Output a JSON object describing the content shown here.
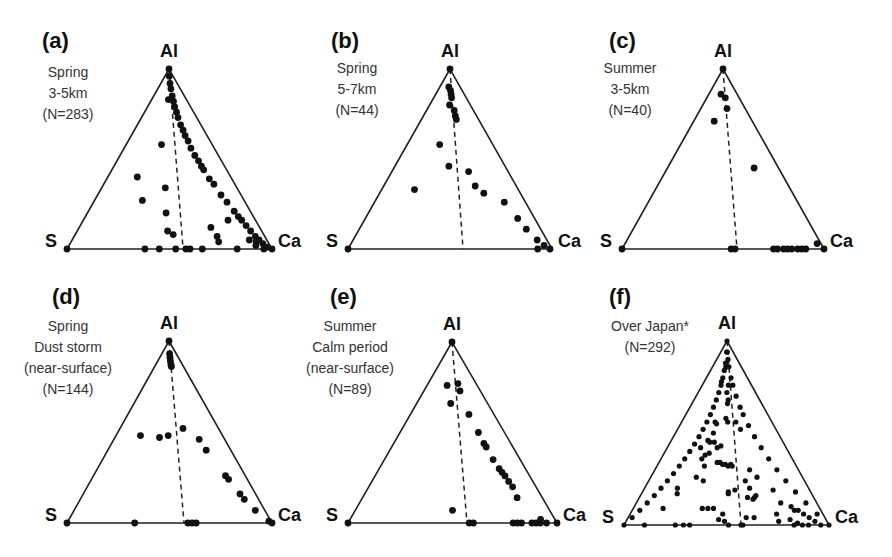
{
  "chart_data": [
    {
      "type": "scatter",
      "subtype": "ternary",
      "panel": "(a)",
      "title_lines": [
        "Spring",
        "3-5km",
        "(N=283)"
      ],
      "vertices": {
        "top": "Al",
        "left": "S",
        "right": "Ca"
      },
      "geom": {
        "apex": [
          169,
          69
        ],
        "left": [
          67,
          249
        ],
        "right": [
          272,
          249
        ],
        "dash_end": [
          183,
          248
        ],
        "letter_pos": [
          42,
          48
        ],
        "text_x": 68,
        "text_y": 77
      },
      "points_uv": [
        [
          0.5,
          1
        ],
        [
          0.54,
          0.96
        ],
        [
          0.56,
          0.92
        ],
        [
          0.58,
          0.89
        ],
        [
          0.6,
          0.85
        ],
        [
          0.62,
          0.82
        ],
        [
          0.63,
          0.79
        ],
        [
          0.65,
          0.76
        ],
        [
          0.66,
          0.73
        ],
        [
          0.68,
          0.69
        ],
        [
          0.7,
          0.66
        ],
        [
          0.71,
          0.63
        ],
        [
          0.73,
          0.6
        ],
        [
          0.74,
          0.56
        ],
        [
          0.76,
          0.52
        ],
        [
          0.78,
          0.49
        ],
        [
          0.79,
          0.46
        ],
        [
          0.8,
          0.44
        ],
        [
          0.82,
          0.39
        ],
        [
          0.84,
          0.36
        ],
        [
          0.86,
          0.3
        ],
        [
          0.88,
          0.26
        ],
        [
          0.9,
          0.21
        ],
        [
          0.91,
          0.18
        ],
        [
          0.92,
          0.16
        ],
        [
          0.93,
          0.13
        ],
        [
          0.94,
          0.1
        ],
        [
          0.95,
          0.07
        ],
        [
          0.96,
          0.05
        ],
        [
          0.97,
          0.03
        ],
        [
          0.98,
          0.01
        ],
        [
          1,
          0
        ],
        [
          0.96,
          0
        ],
        [
          0.93,
          0.02
        ],
        [
          0.91,
          0.05
        ],
        [
          0.94,
          0.04
        ],
        [
          0.84,
          0.16
        ],
        [
          0.73,
          0.12
        ],
        [
          0.75,
          0.07
        ],
        [
          0.75,
          0.04
        ],
        [
          0.66,
          0
        ],
        [
          0.83,
          0
        ],
        [
          0.58,
          0
        ],
        [
          0.6,
          0
        ],
        [
          0.53,
          0
        ],
        [
          0.38,
          0
        ],
        [
          0.45,
          0
        ],
        [
          0,
          0
        ],
        [
          0.24,
          0.4
        ],
        [
          0.32,
          0.27
        ],
        [
          0.48,
          0.83
        ],
        [
          0.41,
          0.58
        ],
        [
          0.47,
          0.34
        ],
        [
          0.48,
          0.2
        ],
        [
          0.49,
          0.1
        ],
        [
          0.52,
          0.08
        ]
      ]
    },
    {
      "type": "scatter",
      "subtype": "ternary",
      "panel": "(b)",
      "title_lines": [
        "Spring",
        "5-7km",
        "(N=44)"
      ],
      "vertices": {
        "top": "Al",
        "left": "S",
        "right": "Ca"
      },
      "geom": {
        "apex": [
          450,
          69
        ],
        "left": [
          348,
          249
        ],
        "right": [
          552,
          249
        ],
        "dash_end": [
          463,
          249
        ],
        "letter_pos": [
          331,
          48
        ],
        "text_x": 357,
        "text_y": 73
      },
      "points_uv": [
        [
          0.5,
          1
        ],
        [
          0.44,
          0.9
        ],
        [
          0.52,
          0.88
        ],
        [
          0.54,
          0.86
        ],
        [
          0.55,
          0.84
        ],
        [
          0.59,
          0.77
        ],
        [
          0.6,
          0.74
        ],
        [
          0.61,
          0.72
        ],
        [
          0.49,
          0.8
        ],
        [
          0.38,
          0.58
        ],
        [
          0.24,
          0.33
        ],
        [
          0.49,
          0.46
        ],
        [
          0.66,
          0.43
        ],
        [
          0.69,
          0.35
        ],
        [
          0.74,
          0.31
        ],
        [
          0.86,
          0.26
        ],
        [
          0.9,
          0.17
        ],
        [
          0.92,
          0.11
        ],
        [
          0.95,
          0.05
        ],
        [
          0.97,
          0.02
        ],
        [
          0.99,
          0
        ],
        [
          0.93,
          0
        ],
        [
          0,
          0
        ]
      ]
    },
    {
      "type": "scatter",
      "subtype": "ternary",
      "panel": "(c)",
      "title_lines": [
        "Summer",
        "3-5km",
        "(N=40)"
      ],
      "vertices": {
        "top": "Al",
        "left": "S",
        "right": "Ca"
      },
      "geom": {
        "apex": [
          723,
          69
        ],
        "left": [
          622,
          249
        ],
        "right": [
          824,
          249
        ],
        "dash_end": [
          737,
          249
        ],
        "letter_pos": [
          609,
          48
        ],
        "text_x": 630,
        "text_y": 73
      },
      "points_uv": [
        [
          0.5,
          1
        ],
        [
          0.43,
          0.86
        ],
        [
          0.35,
          0.71
        ],
        [
          0.57,
          0.84
        ],
        [
          0.59,
          0.78
        ],
        [
          0.78,
          0.45
        ],
        [
          0.98,
          0.03
        ],
        [
          1,
          0
        ],
        [
          0.54,
          0
        ],
        [
          0.56,
          0
        ],
        [
          0.75,
          0
        ],
        [
          0.77,
          0
        ],
        [
          0.8,
          0
        ],
        [
          0.82,
          0
        ],
        [
          0.84,
          0
        ],
        [
          0.87,
          0
        ],
        [
          0.89,
          0
        ],
        [
          0.91,
          0
        ],
        [
          0,
          0
        ]
      ]
    },
    {
      "type": "scatter",
      "subtype": "ternary",
      "panel": "(d)",
      "title_lines": [
        "Spring",
        "Dust storm",
        "(near-surface)",
        "(N=144)"
      ],
      "vertices": {
        "top": "Al",
        "left": "S",
        "right": "Ca"
      },
      "geom": {
        "apex": [
          169,
          341
        ],
        "left": [
          67,
          523
        ],
        "right": [
          272,
          523
        ],
        "dash_end": [
          184,
          523
        ],
        "letter_pos": [
          52,
          304
        ],
        "text_x": 68,
        "text_y": 331
      },
      "points_uv": [
        [
          0.5,
          1
        ],
        [
          0.54,
          0.93
        ],
        [
          0.55,
          0.91
        ],
        [
          0.56,
          0.89
        ],
        [
          0.57,
          0.87
        ],
        [
          0.58,
          0.86
        ],
        [
          0.77,
          0.46
        ],
        [
          0.8,
          0.4
        ],
        [
          0.87,
          0.26
        ],
        [
          0.88,
          0.24
        ],
        [
          0.91,
          0.16
        ],
        [
          0.92,
          0.13
        ],
        [
          0.95,
          0.07
        ],
        [
          0.99,
          0.01
        ],
        [
          1,
          0
        ],
        [
          0.23,
          0.48
        ],
        [
          0.41,
          0.47
        ],
        [
          0.49,
          0.48
        ],
        [
          0.64,
          0.52
        ],
        [
          0,
          0
        ],
        [
          0.33,
          0
        ],
        [
          0.59,
          0
        ],
        [
          0.61,
          0
        ],
        [
          0.63,
          0
        ]
      ]
    },
    {
      "type": "scatter",
      "subtype": "ternary",
      "panel": "(e)",
      "title_lines": [
        "Summer",
        "Calm period",
        "(near-surface)",
        "(N=89)"
      ],
      "vertices": {
        "top": "Al",
        "left": "S",
        "right": "Ca"
      },
      "geom": {
        "apex": [
          452,
          342
        ],
        "left": [
          348,
          523
        ],
        "right": [
          557,
          523
        ],
        "dash_end": [
          467,
          523
        ],
        "letter_pos": [
          330,
          304
        ],
        "text_x": 350,
        "text_y": 331
      },
      "points_uv": [
        [
          0.5,
          1
        ],
        [
          0.4,
          0.76
        ],
        [
          0.62,
          0.77
        ],
        [
          0.64,
          0.73
        ],
        [
          0.7,
          0.6
        ],
        [
          0.75,
          0.5
        ],
        [
          0.77,
          0.44
        ],
        [
          0.78,
          0.42
        ],
        [
          0.8,
          0.35
        ],
        [
          0.82,
          0.3
        ],
        [
          0.83,
          0.28
        ],
        [
          0.84,
          0.26
        ],
        [
          0.85,
          0.23
        ],
        [
          0.86,
          0.2
        ],
        [
          0.86,
          0.14
        ],
        [
          0.93,
          0.02
        ],
        [
          0.48,
          0.66
        ],
        [
          0.5,
          0.07
        ],
        [
          0.58,
          0
        ],
        [
          0.6,
          0
        ],
        [
          0.79,
          0
        ],
        [
          0.81,
          0
        ],
        [
          0.83,
          0
        ],
        [
          0.88,
          0
        ],
        [
          0.9,
          0
        ],
        [
          0.92,
          0
        ],
        [
          0.95,
          0
        ],
        [
          1,
          0
        ],
        [
          0,
          0
        ]
      ]
    },
    {
      "type": "scatter",
      "subtype": "ternary",
      "panel": "(f)",
      "title_lines": [
        "Over Japan*",
        "(N=292)"
      ],
      "vertices": {
        "top": "Al",
        "left": "S",
        "right": "Ca"
      },
      "geom": {
        "apex": [
          727,
          341
        ],
        "left": [
          624,
          525
        ],
        "right": [
          829,
          525
        ],
        "dash_end": [
          741,
          525
        ],
        "letter_pos": [
          609,
          304
        ],
        "text_x": 650,
        "text_y": 331
      },
      "points_uv": [
        [
          0.5,
          1
        ],
        [
          0.47,
          0.94
        ],
        [
          0.44,
          0.88
        ],
        [
          0.42,
          0.84
        ],
        [
          0.4,
          0.8
        ],
        [
          0.38,
          0.76
        ],
        [
          0.36,
          0.72
        ],
        [
          0.34,
          0.68
        ],
        [
          0.32,
          0.64
        ],
        [
          0.3,
          0.6
        ],
        [
          0.28,
          0.56
        ],
        [
          0.26,
          0.52
        ],
        [
          0.24,
          0.48
        ],
        [
          0.22,
          0.44
        ],
        [
          0.2,
          0.4
        ],
        [
          0.18,
          0.36
        ],
        [
          0.16,
          0.32
        ],
        [
          0.14,
          0.28
        ],
        [
          0.12,
          0.24
        ],
        [
          0.1,
          0.2
        ],
        [
          0.08,
          0.16
        ],
        [
          0.06,
          0.12
        ],
        [
          0.04,
          0.08
        ],
        [
          0.02,
          0.04
        ],
        [
          0.53,
          0.94
        ],
        [
          0.55,
          0.9
        ],
        [
          0.57,
          0.86
        ],
        [
          0.6,
          0.8
        ],
        [
          0.62,
          0.76
        ],
        [
          0.65,
          0.7
        ],
        [
          0.68,
          0.64
        ],
        [
          0.7,
          0.6
        ],
        [
          0.73,
          0.54
        ],
        [
          0.76,
          0.48
        ],
        [
          0.79,
          0.42
        ],
        [
          0.82,
          0.36
        ],
        [
          0.85,
          0.3
        ],
        [
          0.88,
          0.24
        ],
        [
          0.91,
          0.18
        ],
        [
          0.94,
          0.12
        ],
        [
          0.97,
          0.06
        ],
        [
          1,
          0
        ],
        [
          0,
          0
        ],
        [
          0.1,
          0
        ],
        [
          0.25,
          0
        ],
        [
          0.29,
          0
        ],
        [
          0.32,
          0
        ],
        [
          0.51,
          0
        ],
        [
          0.57,
          0
        ],
        [
          0.58,
          0
        ],
        [
          0.83,
          0
        ],
        [
          0.87,
          0
        ],
        [
          0.9,
          0
        ],
        [
          0.96,
          0
        ],
        [
          0.46,
          0.86
        ],
        [
          0.5,
          0.86
        ],
        [
          0.38,
          0.78
        ],
        [
          0.53,
          0.76
        ],
        [
          0.5,
          0.72
        ],
        [
          0.52,
          0.68
        ],
        [
          0.51,
          0.66
        ],
        [
          0.37,
          0.56
        ],
        [
          0.39,
          0.55
        ],
        [
          0.37,
          0.5
        ],
        [
          0.49,
          0.58
        ],
        [
          0.51,
          0.56
        ],
        [
          0.6,
          0.56
        ],
        [
          0.64,
          0.52
        ],
        [
          0.33,
          0.46
        ],
        [
          0.39,
          0.45
        ],
        [
          0.42,
          0.42
        ],
        [
          0.45,
          0.43
        ],
        [
          0.28,
          0.42
        ],
        [
          0.33,
          0.38
        ],
        [
          0.36,
          0.39
        ],
        [
          0.35,
          0.45
        ],
        [
          0.31,
          0.36
        ],
        [
          0.34,
          0.32
        ],
        [
          0.43,
          0.34
        ],
        [
          0.45,
          0.34
        ],
        [
          0.47,
          0.33
        ],
        [
          0.49,
          0.33
        ],
        [
          0.51,
          0.32
        ],
        [
          0.53,
          0.33
        ],
        [
          0.54,
          0.32
        ],
        [
          0.3,
          0.26
        ],
        [
          0.35,
          0.24
        ],
        [
          0.66,
          0.3
        ],
        [
          0.7,
          0.26
        ],
        [
          0.2,
          0.2
        ],
        [
          0.21,
          0.17
        ],
        [
          0.55,
          0.19
        ],
        [
          0.51,
          0.18
        ],
        [
          0.62,
          0.24
        ],
        [
          0.64,
          0.2
        ],
        [
          0.62,
          0.15
        ],
        [
          0.65,
          0.14
        ],
        [
          0.66,
          0.15
        ],
        [
          0.67,
          0.16
        ],
        [
          0.78,
          0.19
        ],
        [
          0.37,
          0.09
        ],
        [
          0.4,
          0.09
        ],
        [
          0.43,
          0.09
        ],
        [
          0.51,
          0.17
        ],
        [
          0.16,
          0.09
        ],
        [
          0.48,
          0.06
        ],
        [
          0.46,
          0.03
        ],
        [
          0.49,
          0.02
        ],
        [
          0.6,
          0.04
        ],
        [
          0.64,
          0.04
        ],
        [
          0.76,
          0.06
        ],
        [
          0.76,
          0.02
        ],
        [
          0.8,
          0.12
        ],
        [
          0.85,
          0.1
        ],
        [
          0.86,
          0.08
        ],
        [
          0.88,
          0.08
        ],
        [
          0.9,
          0.06
        ],
        [
          0.92,
          0.04
        ],
        [
          0.82,
          0.03
        ],
        [
          0.94,
          0.02
        ],
        [
          0.85,
          0.01
        ]
      ]
    }
  ],
  "dash_style": "dashed line from Al apex to S-Ca base"
}
